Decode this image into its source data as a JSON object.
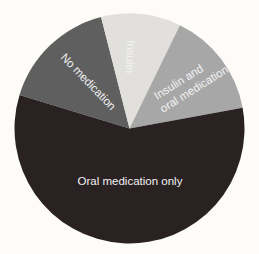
{
  "chart_data": {
    "type": "pie",
    "title": "",
    "center": [
      129.5,
      128.5
    ],
    "radius": 115,
    "start_angle_deg": 163,
    "direction": "clockwise",
    "slices": [
      {
        "label": "No medication",
        "value": 16.3,
        "color": "#5f5f5f",
        "label_lines": [
          "No medication"
        ]
      },
      {
        "label": "Insulin",
        "value": 11.2,
        "color": "#e1e0dc",
        "label_lines": [
          "Insulin"
        ]
      },
      {
        "label": "Insulin and oral medication",
        "value": 14.9,
        "color": "#a7a7a7",
        "label_lines": [
          "Insulin and",
          "oral medication"
        ]
      },
      {
        "label": "Oral medication only",
        "value": 57.6,
        "color": "#2a2222",
        "label_lines": [
          "Oral medication only"
        ]
      }
    ],
    "legend": "none",
    "background": "#fdfcf8"
  }
}
